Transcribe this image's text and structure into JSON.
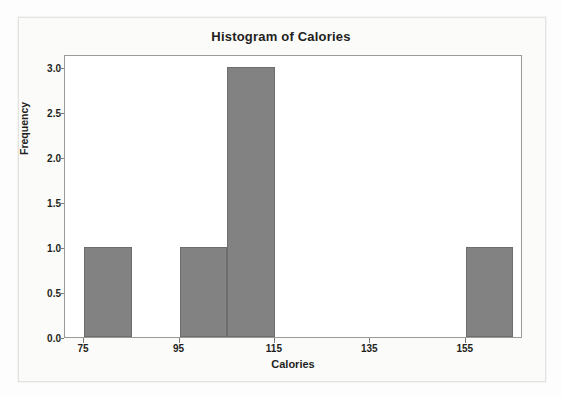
{
  "chart_data": {
    "type": "bar",
    "title": "Histogram of Calories",
    "xlabel": "Calories",
    "ylabel": "Frequency",
    "bin_width": 10,
    "bin_starts": [
      75,
      85,
      95,
      105,
      115,
      125,
      135,
      145,
      155,
      165
    ],
    "categories": [
      "75-85",
      "85-95",
      "95-105",
      "105-115",
      "115-125",
      "125-135",
      "135-145",
      "145-155",
      "155-165"
    ],
    "values": [
      1,
      0,
      1,
      3,
      0,
      0,
      0,
      0,
      1
    ],
    "xlim": [
      71,
      167
    ],
    "ylim": [
      0,
      3.15
    ],
    "xticks": [
      75,
      95,
      115,
      135,
      155
    ],
    "xtick_labels": [
      "75",
      "95",
      "115",
      "135",
      "155"
    ],
    "yticks": [
      0.0,
      0.5,
      1.0,
      1.5,
      2.0,
      2.5,
      3.0
    ],
    "ytick_labels": [
      "0.0",
      "0.5",
      "1.0",
      "1.5",
      "2.0",
      "2.5",
      "3.0"
    ],
    "grid": false,
    "legend": false,
    "bar_color": "#828282",
    "bar_edge_color": "#6d6d6d",
    "plot_background": "#ffffff",
    "axis_color": "#9a9a9a",
    "text_color": "#231f20"
  }
}
